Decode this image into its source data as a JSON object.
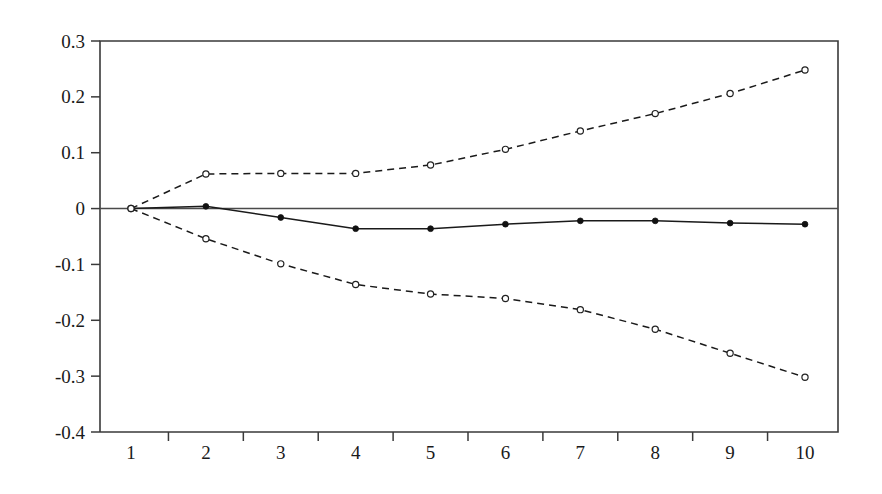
{
  "chart_data": {
    "type": "line",
    "title": "",
    "subtitle": "",
    "xlabel": "",
    "ylabel": "",
    "x": [
      1,
      2,
      3,
      4,
      5,
      6,
      7,
      8,
      9,
      10
    ],
    "xtick_labels": [
      "1",
      "2",
      "3",
      "4",
      "5",
      "6",
      "7",
      "8",
      "9",
      "10"
    ],
    "ytick_labels": [
      "0.3",
      "0.2",
      "0.1",
      "0",
      "-0.1",
      "-0.2",
      "-0.3",
      "-0.4"
    ],
    "ytick_values": [
      0.3,
      0.2,
      0.1,
      0,
      -0.1,
      -0.2,
      -0.3,
      -0.4
    ],
    "xlim": [
      0.7,
      10.3
    ],
    "ylim": [
      -0.4,
      0.3
    ],
    "grid": false,
    "legend": "none",
    "zero_reference_line": 0,
    "series": [
      {
        "name": "upper-confidence-band",
        "style": "dashed",
        "marker": "open-circle",
        "color": "#1a1a1a",
        "values": [
          0.0,
          0.062,
          0.063,
          0.063,
          0.078,
          0.106,
          0.139,
          0.17,
          0.206,
          0.248
        ]
      },
      {
        "name": "point-estimate",
        "style": "solid",
        "marker": "filled-circle",
        "color": "#1a1a1a",
        "values": [
          0.0,
          0.004,
          -0.016,
          -0.036,
          -0.036,
          -0.028,
          -0.022,
          -0.022,
          -0.026,
          -0.028
        ]
      },
      {
        "name": "lower-confidence-band",
        "style": "dashed",
        "marker": "open-circle",
        "color": "#1a1a1a",
        "values": [
          0.0,
          -0.054,
          -0.099,
          -0.136,
          -0.153,
          -0.161,
          -0.181,
          -0.216,
          -0.259,
          -0.302
        ]
      }
    ]
  },
  "plot_geometry": {
    "left_px": 100,
    "right_px": 838,
    "top_px": 41,
    "bottom_px": 432,
    "first_point_px": 131,
    "last_point_px": 805
  }
}
